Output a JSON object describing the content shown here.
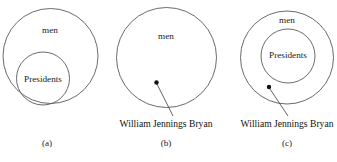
{
  "figure": {
    "background_color": "#ffffff",
    "stroke_color": "#5a5a5a",
    "dot_color": "#111111",
    "panels": [
      {
        "caption": "(a)",
        "outer_set_label": "men",
        "inner_set_label": "Presidents",
        "point_label": "",
        "has_point": false,
        "description": "Presidents circle nested inside men circle, no marked individual"
      },
      {
        "caption": "(b)",
        "outer_set_label": "men",
        "inner_set_label": "",
        "point_label": "William Jennings Bryan",
        "has_point": true,
        "description": "single men circle with a point inside labeled William Jennings Bryan"
      },
      {
        "caption": "(c)",
        "outer_set_label": "men",
        "inner_set_label": "Presidents",
        "point_label": "William Jennings Bryan",
        "has_point": true,
        "description": "Presidents circle nested inside men circle with a point in men but outside Presidents"
      }
    ]
  }
}
